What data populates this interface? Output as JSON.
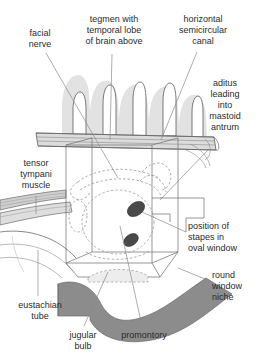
{
  "diagram": {
    "colors": {
      "background": "#ffffff",
      "text": "#2b2b2b",
      "leader_line": "#777777",
      "outline": "#555555",
      "mastoid_cell_fill": "#e2e2e2",
      "air_cell_interior": "#ffffff",
      "tegmen_band": "#d8d8d8",
      "jugular_bulb_fill": "#8c8c8c",
      "ossicle_fill": "#4a4a4a",
      "muscle_stripe": "#c9c9c9",
      "dashed_outline": "#9a9a9a"
    },
    "labels": [
      {
        "id": "facial-nerve",
        "text": "facial\nnerve",
        "align": "center",
        "x": 10,
        "y": 28,
        "w": 60
      },
      {
        "id": "tegmen",
        "text": "tegmen with\ntemporal lobe\nof brain above",
        "align": "center",
        "x": 76,
        "y": 14,
        "w": 76
      },
      {
        "id": "horizontal-canal",
        "text": "horizontal\nsemicircular\ncanal",
        "align": "center",
        "x": 167,
        "y": 14,
        "w": 72
      },
      {
        "id": "aditus",
        "text": "aditus\nleading\ninto\nmastoid\nantrum",
        "align": "center",
        "x": 196,
        "y": 78,
        "w": 58
      },
      {
        "id": "tensor-tympani",
        "text": "tensor\ntympani\nmuscle",
        "align": "center",
        "x": 8,
        "y": 158,
        "w": 56
      },
      {
        "id": "stapes-oval-window",
        "text": "position of\nstapes in\noval window",
        "align": "left",
        "x": 188,
        "y": 221,
        "w": 70
      },
      {
        "id": "round-window-niche",
        "text": "round\nwindow\nniche",
        "align": "left",
        "x": 212,
        "y": 270,
        "w": 46
      },
      {
        "id": "eustachian-tube",
        "text": "eustachian\ntube",
        "align": "center",
        "x": 8,
        "y": 300,
        "w": 64
      },
      {
        "id": "jugular-bulb",
        "text": "jugular\nbulb",
        "align": "center",
        "x": 59,
        "y": 330,
        "w": 48
      },
      {
        "id": "promontory",
        "text": "promontory",
        "align": "center",
        "x": 112,
        "y": 330,
        "w": 64
      }
    ],
    "structures": [
      {
        "id": "mastoid-air-cells",
        "name": "mastoid air cells"
      },
      {
        "id": "tegmen-plate",
        "name": "tegmen plate"
      },
      {
        "id": "tympanic-cavity-box",
        "name": "tympanic cavity wireframe box"
      },
      {
        "id": "semicircular-canal",
        "name": "horizontal semicircular canal outline"
      },
      {
        "id": "promontory-dome",
        "name": "promontory dome"
      },
      {
        "id": "stapes-oval",
        "name": "stapes in oval window"
      },
      {
        "id": "round-window-oval",
        "name": "round window"
      },
      {
        "id": "tensor-tympani-band",
        "name": "tensor tympani muscle band"
      },
      {
        "id": "eustachian-band",
        "name": "eustachian tube band"
      },
      {
        "id": "jugular-bulb-band",
        "name": "jugular bulb"
      }
    ]
  }
}
